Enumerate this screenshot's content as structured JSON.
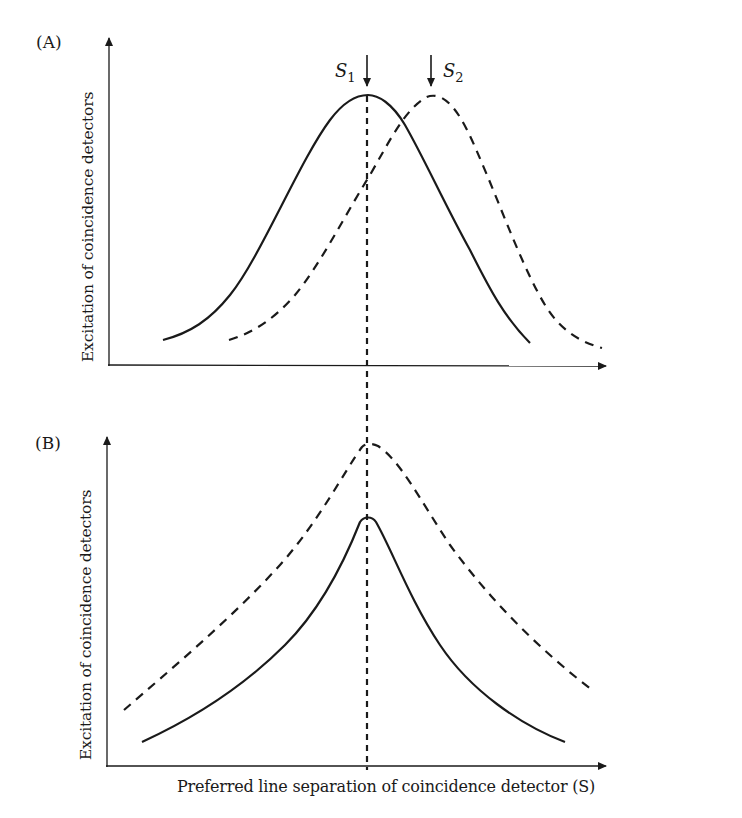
{
  "figure": {
    "panel_a": {
      "label": "(A)",
      "ylabel": "Excitation of coincidence detectors",
      "markers": [
        {
          "name": "S",
          "sub": "1"
        },
        {
          "name": "S",
          "sub": "2"
        }
      ]
    },
    "panel_b": {
      "label": "(B)",
      "ylabel": "Excitation of coincidence detectors"
    },
    "xlabel": "Preferred line separation of coincidence detector (S)",
    "colors": {
      "ink": "#1a1a1a",
      "background": "#ffffff"
    }
  }
}
